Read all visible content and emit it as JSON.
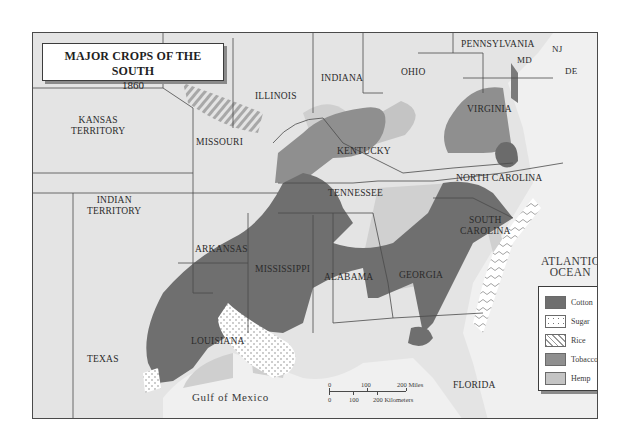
{
  "title": {
    "line1": "MAJOR CROPS OF THE SOUTH",
    "line2": "1860"
  },
  "states": {
    "illinois": "ILLINOIS",
    "indiana": "INDIANA",
    "ohio": "OHIO",
    "pennsylvania": "PENNSYLVANIA",
    "nj": "NJ",
    "md": "MD",
    "de": "DE",
    "kansas": "KANSAS",
    "kansas2": "TERRITORY",
    "missouri": "MISSOURI",
    "kentucky": "KENTUCKY",
    "virginia": "VIRGINIA",
    "indian": "INDIAN",
    "indian2": "TERRITORY",
    "arkansas": "ARKANSAS",
    "tennessee": "TENNESSEE",
    "north_carolina": "NORTH CAROLINA",
    "south_carolina": "SOUTH",
    "south_carolina2": "CAROLINA",
    "mississippi": "MISSISSIPPI",
    "alabama": "ALABAMA",
    "georgia": "GEORGIA",
    "louisiana": "LOUISIANA",
    "texas": "TEXAS",
    "florida": "FLORIDA"
  },
  "water": {
    "atlantic1": "ATLANTIC",
    "atlantic2": "OCEAN",
    "gulf": "Gulf of Mexico"
  },
  "legend": {
    "items": [
      {
        "label": "Cotton",
        "color": "#6f6f6f",
        "pattern": "solid"
      },
      {
        "label": "Sugar",
        "color": "#ffffff",
        "pattern": "dots"
      },
      {
        "label": "Rice",
        "color": "#ffffff",
        "pattern": "squiggle"
      },
      {
        "label": "Tobacco",
        "color": "#8f8f8f",
        "pattern": "solid"
      },
      {
        "label": "Hemp",
        "color": "#c4c4c4",
        "pattern": "solid"
      }
    ]
  },
  "scale": {
    "miles_0": "0",
    "miles_100": "100",
    "miles_200": "200 Miles",
    "km_0": "0",
    "km_100": "100",
    "km_200": "200 Kilometers"
  },
  "colors": {
    "land": "#e4e4e4",
    "water": "#f2f2f2",
    "cotton": "#6f6f6f",
    "tobacco": "#8f8f8f",
    "hemp": "#c4c4c4",
    "border": "#4a4a4a"
  }
}
